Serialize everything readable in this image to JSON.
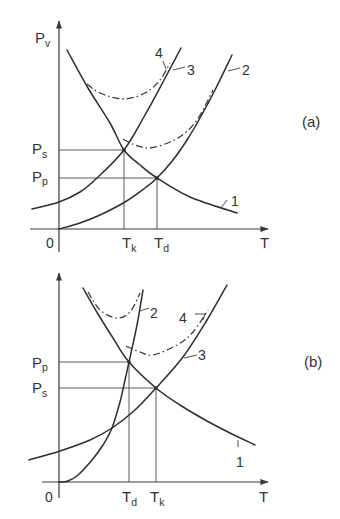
{
  "figure": {
    "panels": [
      {
        "id": "a",
        "panel_label": "(a)",
        "y_axis": {
          "main": "P",
          "sub": "v"
        },
        "x_axis": "T",
        "origin": "0",
        "y_marks": [
          {
            "main": "P",
            "sub": "s"
          },
          {
            "main": "P",
            "sub": "p"
          }
        ],
        "x_marks": [
          {
            "main": "T",
            "sub": "k"
          },
          {
            "main": "T",
            "sub": "d"
          }
        ],
        "curve_labels": {
          "c1": "1",
          "c2": "2",
          "c3": "3",
          "c4": "4"
        },
        "curves": {
          "c1": [
            [
              67,
              50
            ],
            [
              88,
              88
            ],
            [
              110,
              123
            ],
            [
              124,
              150
            ],
            [
              140,
              165
            ],
            [
              157,
              178
            ],
            [
              190,
              197
            ],
            [
              237,
              213
            ]
          ],
          "c3": [
            [
              32,
              209
            ],
            [
              59,
              202
            ],
            [
              80,
              192
            ],
            [
              97,
              178
            ],
            [
              124,
              150
            ],
            [
              145,
              115
            ],
            [
              163,
              82
            ],
            [
              181,
              48
            ]
          ],
          "c2": [
            [
              59,
              229
            ],
            [
              80,
              223
            ],
            [
              100,
              215
            ],
            [
              125,
              202
            ],
            [
              145,
              188
            ],
            [
              157,
              178
            ],
            [
              173,
              160
            ],
            [
              187,
              140
            ],
            [
              200,
              118
            ],
            [
              215,
              90
            ],
            [
              232,
              55
            ]
          ],
          "c4_upper": [
            [
              87,
              84
            ],
            [
              100,
              93
            ],
            [
              123,
              99
            ],
            [
              145,
              93
            ],
            [
              160,
              80
            ],
            [
              170,
              63
            ]
          ],
          "c4_lower": [
            [
              123,
              139
            ],
            [
              135,
              145
            ],
            [
              150,
              148
            ],
            [
              170,
              142
            ],
            [
              185,
              133
            ],
            [
              197,
              120
            ],
            [
              206,
              104
            ],
            [
              213,
              90
            ]
          ]
        }
      },
      {
        "id": "b",
        "panel_label": "(b)",
        "x_axis": "T",
        "origin": "0",
        "y_marks": [
          {
            "main": "P",
            "sub": "p"
          },
          {
            "main": "P",
            "sub": "s"
          }
        ],
        "x_marks": [
          {
            "main": "T",
            "sub": "d"
          },
          {
            "main": "T",
            "sub": "k"
          }
        ],
        "curve_labels": {
          "c1": "1",
          "c2": "2",
          "c3": "3",
          "c4": "4"
        },
        "curves": {
          "c1": [
            [
              83,
              288
            ],
            [
              98,
              314
            ],
            [
              113,
              338
            ],
            [
              129,
              362
            ],
            [
              156,
              388
            ],
            [
              180,
              405
            ],
            [
              207,
              421
            ],
            [
              230,
              433
            ],
            [
              255,
              445
            ]
          ],
          "c2": [
            [
              59,
              482
            ],
            [
              68,
              481
            ],
            [
              78,
              475
            ],
            [
              92,
              460
            ],
            [
              103,
              445
            ],
            [
              112,
              428
            ],
            [
              120,
              402
            ],
            [
              125,
              380
            ],
            [
              129,
              362
            ],
            [
              137,
              325
            ],
            [
              143,
              290
            ]
          ],
          "c3": [
            [
              29,
              460
            ],
            [
              60,
              451
            ],
            [
              90,
              440
            ],
            [
              112,
              428
            ],
            [
              135,
              410
            ],
            [
              156,
              388
            ],
            [
              183,
              357
            ],
            [
              207,
              320
            ],
            [
              227,
              285
            ]
          ],
          "c4_upper": [
            [
              88,
              292
            ],
            [
              100,
              310
            ],
            [
              117,
              318
            ],
            [
              130,
              312
            ],
            [
              140,
              293
            ]
          ],
          "c4_lower": [
            [
              126,
              346
            ],
            [
              140,
              352
            ],
            [
              153,
              355
            ],
            [
              177,
              345
            ],
            [
              193,
              332
            ],
            [
              208,
              310
            ]
          ]
        }
      }
    ]
  }
}
